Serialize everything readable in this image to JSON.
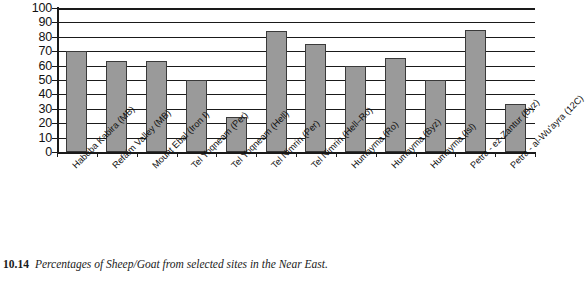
{
  "figure": {
    "caption_number": "10.14",
    "caption_text": "Percentages of Sheep/Goat from selected sites in the Near East."
  },
  "chart_data": {
    "type": "bar",
    "title": "",
    "xlabel": "",
    "ylabel": "",
    "ylim": [
      0,
      100
    ],
    "ytick_step": 10,
    "grid": true,
    "legend": "none",
    "bar_color": "#9a9a9a",
    "bar_border_color": "#3a3a3a",
    "axis_color": "#1a1a1a",
    "ytick_labels": [
      "100",
      "90",
      "80",
      "70",
      "60",
      "50",
      "40",
      "30",
      "20",
      "10",
      "0"
    ],
    "categories": [
      "Habuba Kabira (MB)",
      "Refaim Valley (MB)",
      "Mount Ebal (Iron I)",
      "Tel Yoqneam (Per)",
      "Tel Yoqneam (Hell)",
      "Tel Nimrin (Per)",
      "Tel Nimrin (Hell–Ro)",
      "Humayma (Ro)",
      "Humayma (Byz)",
      "Humayma (Isl)",
      "Petra - ez-Zantur (Byz)",
      "Petra - al-Wu'ayra (12C)"
    ],
    "values": [
      70,
      63,
      63,
      50,
      24,
      84,
      75,
      60,
      65,
      50,
      85,
      33
    ]
  }
}
